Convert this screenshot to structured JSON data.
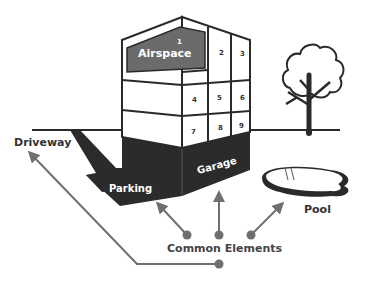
{
  "diagram": {
    "colors": {
      "outline": "#2a2a2a",
      "airspace_fill": "#6b6b6b",
      "dark_fill": "#2b2b2b",
      "arrow": "#6f6f6f",
      "label_dark": "#333333",
      "label_light": "#ffffff"
    },
    "labels": {
      "airspace": "Airspace",
      "driveway": "Driveway",
      "parking": "Parking",
      "garage": "Garage",
      "pool": "Pool",
      "common_elements": "Common Elements"
    },
    "units": [
      "1",
      "2",
      "3",
      "4",
      "5",
      "6",
      "7",
      "8",
      "9"
    ],
    "icons": [
      "building",
      "tree",
      "pool",
      "driveway-ramp"
    ]
  }
}
